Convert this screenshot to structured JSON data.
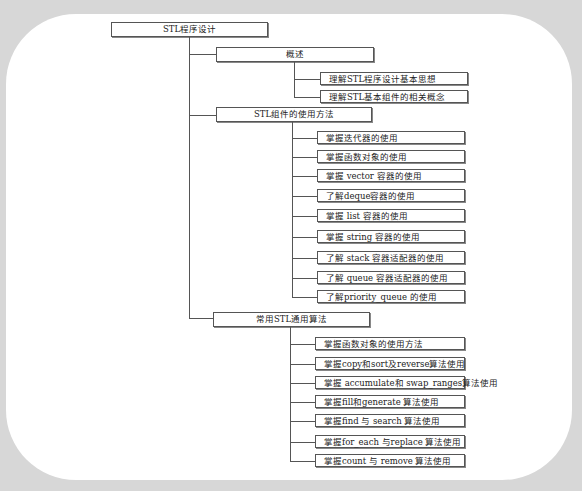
{
  "title": "STL程序设计",
  "sections": [
    {
      "label": "概述",
      "items": [
        "理解STL程序设计基本思想",
        "理解STL基本组件的相关概念"
      ]
    },
    {
      "label": "STL组件的使用方法",
      "items": [
        "掌握迭代器的使用",
        "掌握函数对象的使用",
        "掌握 vector 容器的使用",
        "了解deque容器的使用",
        "掌握 list 容器的使用",
        "掌握 string 容器的使用",
        "了解 stack 容器适配器的使用",
        "了解 queue 容器适配器的使用",
        "了解priority_queue 的使用"
      ]
    },
    {
      "label": "常用STL通用算法",
      "items": [
        "掌握函数对象的使用方法",
        "掌握copy和sort及reverse算法使用",
        "掌握 accumulate和 swap_ranges算法使用",
        "掌握fill和generate 算法使用",
        "掌握find 与 search 算法使用",
        "掌握for_each 与replace 算法使用",
        "掌握count 与 remove 算法使用"
      ]
    }
  ]
}
